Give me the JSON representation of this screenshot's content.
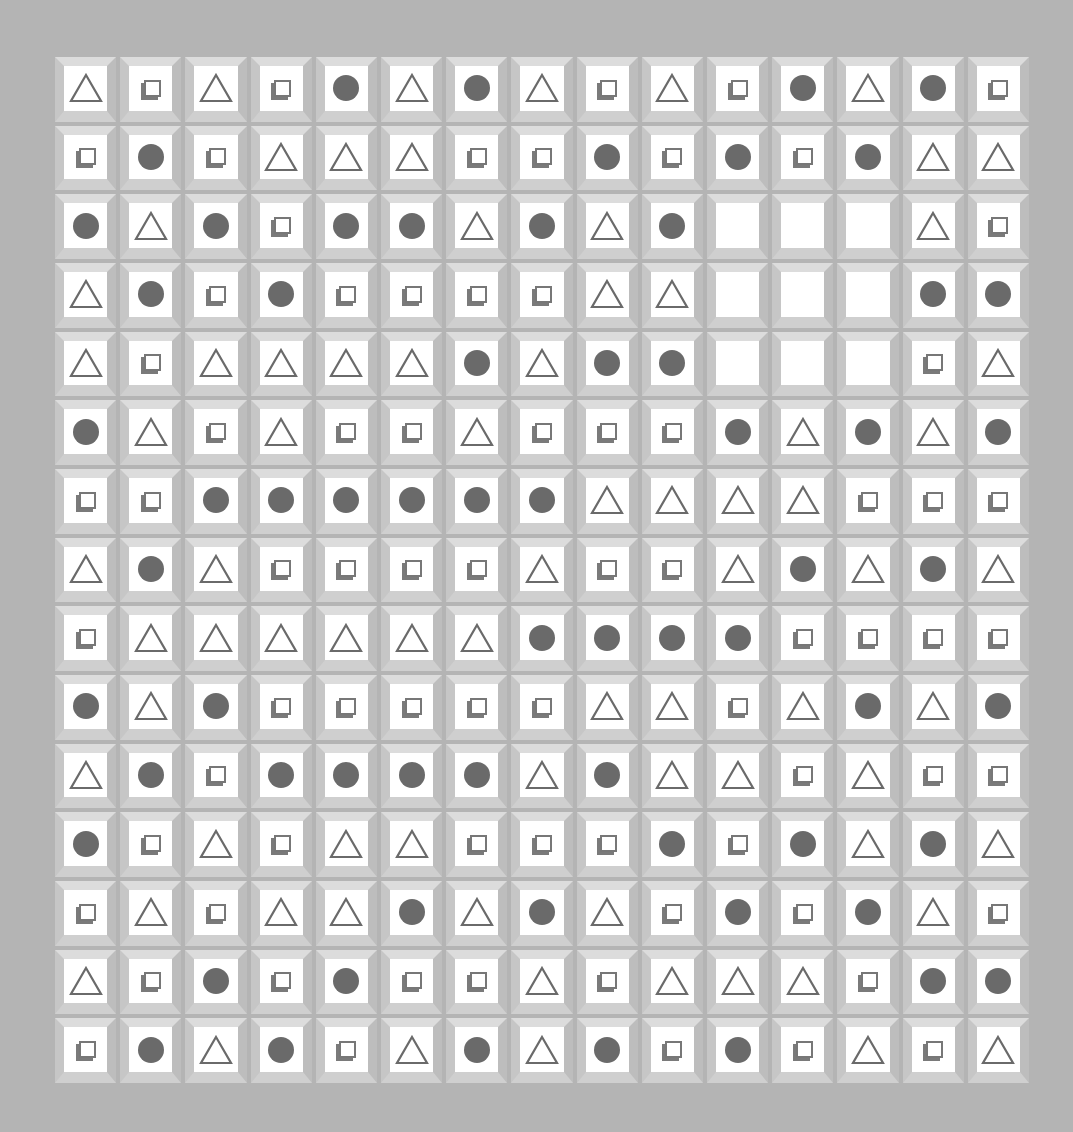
{
  "board": {
    "rows": 15,
    "cols": 15,
    "colors": {
      "background": "#b4b4b4",
      "tile_face": "#ffffff",
      "glyph": "#6a6a6a"
    },
    "legend": {
      "C": "circle",
      "T": "triangle",
      "S": "square",
      "E": "empty"
    },
    "grid": [
      [
        "T",
        "S",
        "T",
        "S",
        "C",
        "T",
        "C",
        "T",
        "S",
        "T",
        "S",
        "C",
        "T",
        "C",
        "S"
      ],
      [
        "S",
        "C",
        "S",
        "T",
        "T",
        "T",
        "S",
        "S",
        "C",
        "S",
        "C",
        "S",
        "C",
        "T",
        "T"
      ],
      [
        "C",
        "T",
        "C",
        "S",
        "C",
        "C",
        "T",
        "C",
        "T",
        "C",
        "E",
        "E",
        "E",
        "T",
        "S"
      ],
      [
        "T",
        "C",
        "S",
        "C",
        "S",
        "S",
        "S",
        "S",
        "T",
        "T",
        "E",
        "E",
        "E",
        "C",
        "C"
      ],
      [
        "T",
        "S",
        "T",
        "T",
        "T",
        "T",
        "C",
        "T",
        "C",
        "C",
        "E",
        "E",
        "E",
        "S",
        "T"
      ],
      [
        "C",
        "T",
        "S",
        "T",
        "S",
        "S",
        "T",
        "S",
        "S",
        "S",
        "C",
        "T",
        "C",
        "T",
        "C"
      ],
      [
        "S",
        "S",
        "C",
        "C",
        "C",
        "C",
        "C",
        "C",
        "T",
        "T",
        "T",
        "T",
        "S",
        "S",
        "S"
      ],
      [
        "T",
        "C",
        "T",
        "S",
        "S",
        "S",
        "S",
        "T",
        "S",
        "S",
        "T",
        "C",
        "T",
        "C",
        "T"
      ],
      [
        "S",
        "T",
        "T",
        "T",
        "T",
        "T",
        "T",
        "C",
        "C",
        "C",
        "C",
        "S",
        "S",
        "S",
        "S"
      ],
      [
        "C",
        "T",
        "C",
        "S",
        "S",
        "S",
        "S",
        "S",
        "T",
        "T",
        "S",
        "T",
        "C",
        "T",
        "C"
      ],
      [
        "T",
        "C",
        "S",
        "C",
        "C",
        "C",
        "C",
        "T",
        "C",
        "T",
        "T",
        "S",
        "T",
        "S",
        "S"
      ],
      [
        "C",
        "S",
        "T",
        "S",
        "T",
        "T",
        "S",
        "S",
        "S",
        "C",
        "S",
        "C",
        "T",
        "C",
        "T"
      ],
      [
        "S",
        "T",
        "S",
        "T",
        "T",
        "C",
        "T",
        "C",
        "T",
        "S",
        "C",
        "S",
        "C",
        "T",
        "S"
      ],
      [
        "T",
        "S",
        "C",
        "S",
        "C",
        "S",
        "S",
        "T",
        "S",
        "T",
        "T",
        "T",
        "S",
        "C",
        "C"
      ],
      [
        "S",
        "C",
        "T",
        "C",
        "S",
        "T",
        "C",
        "T",
        "C",
        "S",
        "C",
        "S",
        "T",
        "S",
        "T"
      ]
    ]
  }
}
